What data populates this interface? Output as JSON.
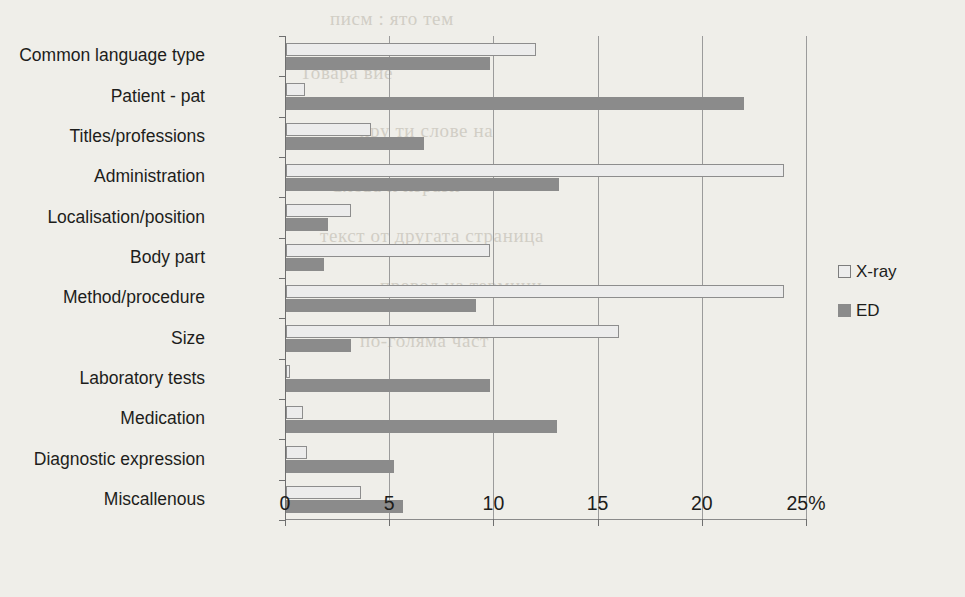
{
  "chart_data": {
    "type": "bar",
    "orientation": "horizontal",
    "title": "",
    "xlabel": "",
    "ylabel": "",
    "xlim": [
      0,
      25
    ],
    "xticks": [
      0,
      5,
      10,
      15,
      20,
      25
    ],
    "xtick_labels": [
      "0",
      "5",
      "10",
      "15",
      "20",
      "25%"
    ],
    "grid": true,
    "grid_axis": "x",
    "legend_position": "right",
    "categories": [
      "Common language type",
      "Patient - pat",
      "Titles/professions",
      "Administration",
      "Localisation/position",
      "Body part",
      "Method/procedure",
      "Size",
      "Laboratory tests",
      "Medication",
      "Diagnostic expression",
      "Miscallenous"
    ],
    "series": [
      {
        "name": "X-ray",
        "color": "#ececec",
        "edge_color": "#8d8d8d",
        "values": [
          12.0,
          0.9,
          4.1,
          23.9,
          3.1,
          9.8,
          23.9,
          16.0,
          0.2,
          0.8,
          1.0,
          3.6
        ]
      },
      {
        "name": "ED",
        "color": "#8b8b8b",
        "edge_color": "#8b8b8b",
        "values": [
          9.8,
          22.0,
          6.6,
          13.1,
          2.0,
          1.8,
          9.1,
          3.1,
          9.8,
          13.0,
          5.2,
          5.6
        ]
      }
    ]
  },
  "legend": {
    "items": [
      {
        "label": "X-ray",
        "swatch": "xray-swatch-icon"
      },
      {
        "label": "ED",
        "swatch": "ed-swatch-icon"
      }
    ]
  },
  "background_text": [
    "писм : ято тем",
    "Товара вие",
    "хру ти слове на",
    "Слова и изрази",
    "текст от другата страница",
    "превод на термини",
    "по-голяма част"
  ]
}
